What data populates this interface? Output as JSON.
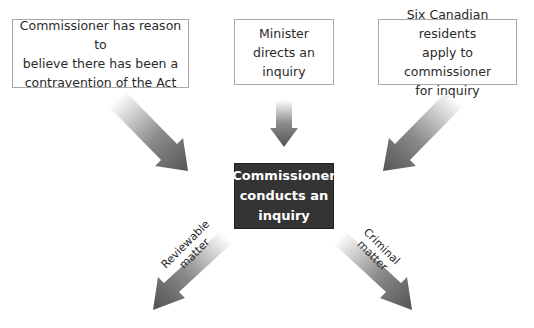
{
  "diagram": {
    "sources": [
      {
        "id": "commissioner-belief",
        "text": "Commissioner has reason to\nbelieve there has been a\ncontravention of the Act"
      },
      {
        "id": "minister-directs",
        "text": "Minister\ndirects an\ninquiry"
      },
      {
        "id": "six-residents",
        "text": "Six Canadian residents\napply to commissioner\nfor inquiry"
      }
    ],
    "center": {
      "text": "Commissioner\nconducts an\ninquiry"
    },
    "outcomes": [
      {
        "id": "reviewable",
        "label": "Reviewable\nmatter"
      },
      {
        "id": "criminal",
        "label": "Criminal\nmatter"
      }
    ],
    "colors": {
      "arrow_dark": "#555555",
      "arrow_light": "#ffffff",
      "center_box": "#343434",
      "box_border": "#a8a8a8"
    }
  }
}
